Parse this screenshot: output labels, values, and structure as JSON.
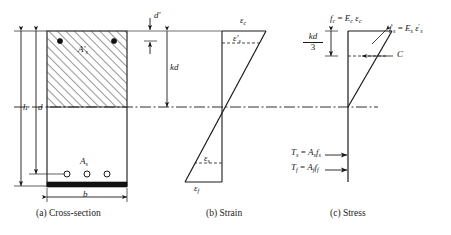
{
  "figure": {
    "width": 451,
    "height": 235,
    "ink_color": "#1a1a1a",
    "panels": [
      {
        "key": "a",
        "caption": "(a)  Cross-section"
      },
      {
        "key": "b",
        "caption": "(b)  Strain"
      },
      {
        "key": "c",
        "caption": "(c)  Stress"
      }
    ]
  },
  "cross_section": {
    "caption": "(a)  Cross-section",
    "dimensions": {
      "h": "h",
      "d": "d",
      "b": "b",
      "d_prime": "d′",
      "kd": "kd"
    },
    "labels": {
      "compression_steel": "A′",
      "compression_steel_sub": "s",
      "tension_steel": "A",
      "tension_steel_sub": "s"
    },
    "rebar_count": 3,
    "frp_layer": "bottom FRP plate"
  },
  "strain": {
    "caption": "(b)  Strain",
    "labels": {
      "concrete_top": "ε",
      "concrete_top_sub": "c",
      "comp_steel": "ε′",
      "comp_steel_sub": "s",
      "tension_steel": "ε",
      "tension_steel_sub": "s",
      "frp": "ε",
      "frp_sub": "f"
    }
  },
  "stress": {
    "caption": "(c)  Stress",
    "equations": {
      "concrete": "f_c = E_c ε_c",
      "comp_steel": "f′_s = E_s ε′_s",
      "resultant_compression": "C",
      "tension_steel": "T_s = A_s f_s",
      "tension_frp": "T_f = A_f f_f"
    },
    "lever_arm": {
      "numerator": "kd",
      "denominator": "3"
    }
  }
}
